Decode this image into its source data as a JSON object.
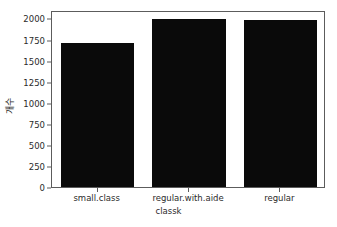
{
  "chart_data": {
    "type": "bar",
    "title": "",
    "xlabel": "classk",
    "ylabel": "개수",
    "categories": [
      "small.class",
      "regular.with.aide",
      "regular"
    ],
    "values": [
      1733,
      2022,
      2010
    ],
    "ylim": [
      0,
      2100
    ],
    "xlim": [
      -0.5,
      2.5
    ],
    "yticks": [
      0,
      250,
      500,
      750,
      1000,
      1250,
      1500,
      1750,
      2000
    ],
    "ytick_labels": [
      "0",
      "250",
      "500",
      "750",
      "1000",
      "1250",
      "1500",
      "1750",
      "2000"
    ],
    "grid": false,
    "legend": null,
    "bar_color": "#0a0a0a",
    "background_color": "#ffffff",
    "axes_color": "#5c5c5c",
    "text_color": "#2b2b2b"
  }
}
